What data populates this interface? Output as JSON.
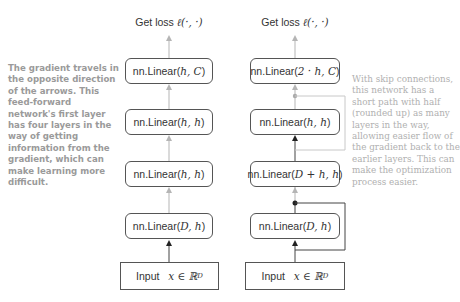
{
  "left_network": {
    "loss_label": "Get loss",
    "loss_math": "ℓ(·, ·)",
    "layers": [
      {
        "prefix": "nn.Linear(",
        "args": "h, C",
        "suffix": ")"
      },
      {
        "prefix": "nn.Linear(",
        "args": "h, h",
        "suffix": ")"
      },
      {
        "prefix": "nn.Linear(",
        "args": "h, h",
        "suffix": ")"
      },
      {
        "prefix": "nn.Linear(",
        "args": "D, h",
        "suffix": ")"
      }
    ],
    "input_label": "Input",
    "input_math": "x ∈ ℝ",
    "input_sup": "D",
    "note": "The gradient travels in the opposite direction of the arrows. This feed-forward network's first layer has four layers in the way of getting information from the gradient, which can make learning more difficult."
  },
  "right_network": {
    "loss_label": "Get loss",
    "loss_math": "ℓ(·, ·)",
    "layers": [
      {
        "prefix": "nn.Linear(",
        "args": "2 · h, C",
        "suffix": ")"
      },
      {
        "prefix": "nn.Linear(",
        "args": "h, h",
        "suffix": ")"
      },
      {
        "prefix": "nn.Linear(",
        "args": "D + h, h",
        "suffix": ")"
      },
      {
        "prefix": "nn.Linear(",
        "args": "D, h",
        "suffix": ")"
      }
    ],
    "input_label": "Input",
    "input_math": "x ∈ ℝ",
    "input_sup": "D",
    "note": "With skip connections, this network has a short path with half (rounded up) as many layers in the way, allowing easier flow of the gradient back to the earlier layers. This can make the optimization process easier."
  },
  "colors": {
    "box_border": "#555555",
    "arrow_light": "#b5b5b5",
    "arrow_dark": "#333333",
    "note_left": "#9a9a9a",
    "note_right": "#b0b0b0"
  }
}
